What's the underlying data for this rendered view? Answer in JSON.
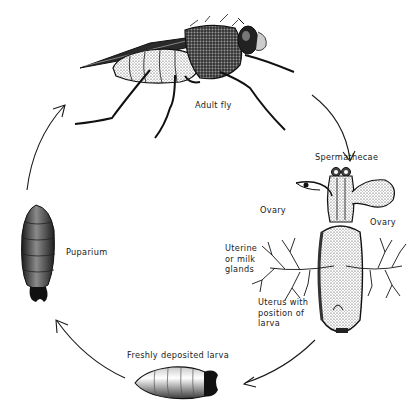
{
  "diagram": {
    "type": "life-cycle",
    "stages": [
      {
        "id": "adult",
        "label": "Adult fly"
      },
      {
        "id": "reproductive",
        "label": "Spermathecae",
        "sublabels": [
          "Ovary",
          "Ovary",
          "Uterine\nor milk\nglands",
          "Uterus with\nposition of\nlarva"
        ]
      },
      {
        "id": "larva",
        "label": "Freshly deposited larva"
      },
      {
        "id": "puparium",
        "label": "Puparium"
      }
    ],
    "cycle_direction": "clockwise"
  },
  "labels": {
    "adult_fly": "Adult fly",
    "spermathecae": "Spermathecae",
    "ovary_left": "Ovary",
    "ovary_right": "Ovary",
    "uterine_glands": "Uterine\nor milk\nglands",
    "uterus": "Uterus with\nposition of\nlarva",
    "larva": "Freshly deposited larva",
    "puparium": "Puparium"
  },
  "colors": {
    "ink": "#1a1a1a",
    "background": "#ffffff",
    "shade": "#6a6a6a"
  }
}
